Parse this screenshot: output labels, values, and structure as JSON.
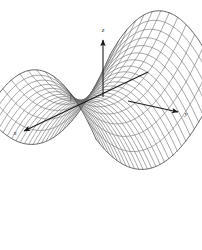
{
  "figure": {
    "background_color": "#ffffff",
    "width": 202,
    "height": 250
  },
  "axes": {
    "z": {
      "label": "z",
      "icon": "arrow-up-icon",
      "label_x": 103,
      "label_y": 32
    },
    "y": {
      "label": "y",
      "icon": "arrow-right-icon",
      "label_x": 185,
      "label_y": 113
    },
    "x": {
      "label": "x",
      "icon": "arrow-down-left-icon",
      "label_x": 15,
      "label_y": 134
    },
    "line_color": "#1a1a1a",
    "origin": {
      "x": 103,
      "y": 97
    }
  },
  "surface": {
    "name": "hyperbolic-paraboloid",
    "mesh_color": "#6b6b6b",
    "outline_color": "#4a4a4a",
    "u_lines": 29,
    "v_lines": 13
  },
  "chart_data": {
    "type": "surface",
    "title": "",
    "xlabel": "x",
    "ylabel": "y",
    "zlabel": "z",
    "equation": "z = x^2 - y^2",
    "surface_name": "hyperbolic paraboloid (saddle)",
    "xlim": [
      -1,
      1
    ],
    "ylim": [
      -1,
      1
    ],
    "zlim": [
      -1,
      1
    ],
    "grid": true,
    "legend": false,
    "projection": "3d-oblique",
    "u_samples": 29,
    "v_samples": 13
  }
}
